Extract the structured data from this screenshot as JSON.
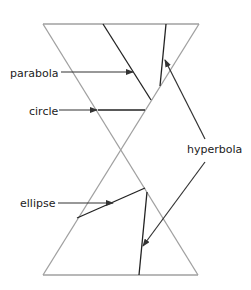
{
  "diagram": {
    "labels": {
      "parabola": "parabola",
      "circle": "circle",
      "hyperbola": "hyperbola",
      "ellipse": "ellipse"
    },
    "colors": {
      "cone": "#a0a0a0",
      "section": "#222222",
      "arrow": "#333333",
      "background": "#ffffff"
    }
  }
}
